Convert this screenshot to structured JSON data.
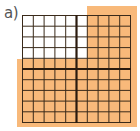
{
  "label": "a)",
  "grid": {
    "rows": 10,
    "cols": 10,
    "thick_col_after": 5,
    "thick_row_after": 5,
    "shaded_cells_description": "Top 5 rows: rightmost 4 columns shaded. Bottom 5 rows: all 10 columns shaded.",
    "shaded_count": 70,
    "total_cells": 100
  },
  "colors": {
    "shade": "#f8b97a",
    "line": "#3a2a1a",
    "background": "#ffffff"
  }
}
